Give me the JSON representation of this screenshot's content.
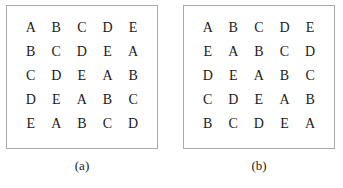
{
  "figure": {
    "type": "latin-squares",
    "background_color": "#ffffff",
    "border_color": "#a9a9a9",
    "text_color": "#1a1a1a",
    "symbols": [
      "A",
      "B",
      "C",
      "D",
      "E"
    ],
    "order": 5
  },
  "panels": [
    {
      "id": "a",
      "caption": "(a)",
      "rows": [
        [
          "A",
          "B",
          "C",
          "D",
          "E"
        ],
        [
          "B",
          "C",
          "D",
          "E",
          "A"
        ],
        [
          "C",
          "D",
          "E",
          "A",
          "B"
        ],
        [
          "D",
          "E",
          "A",
          "B",
          "C"
        ],
        [
          "E",
          "A",
          "B",
          "C",
          "D"
        ]
      ]
    },
    {
      "id": "b",
      "caption": "(b)",
      "rows": [
        [
          "A",
          "B",
          "C",
          "D",
          "E"
        ],
        [
          "E",
          "A",
          "B",
          "C",
          "D"
        ],
        [
          "D",
          "E",
          "A",
          "B",
          "C"
        ],
        [
          "C",
          "D",
          "E",
          "A",
          "B"
        ],
        [
          "B",
          "C",
          "D",
          "E",
          "A"
        ]
      ]
    }
  ]
}
